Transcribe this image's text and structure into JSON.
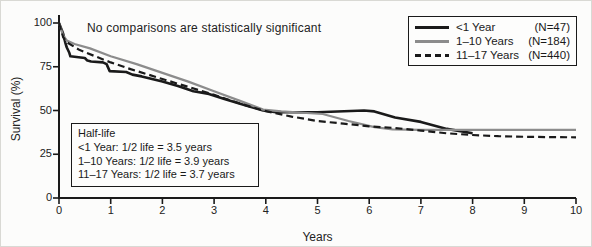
{
  "annotation": "No comparisons are statistically significant",
  "legend": {
    "items": [
      {
        "label": "<1 Year",
        "count": "(N=47)",
        "style": "solid-black"
      },
      {
        "label": "1–10 Years",
        "count": "(N=184)",
        "style": "solid-gray"
      },
      {
        "label": "11–17 Years",
        "count": "(N=440)",
        "style": "dashed-black"
      }
    ]
  },
  "halflife_box": {
    "title": "Half-life",
    "lines": [
      "<1 Year: 1/2 life = 3.5 years",
      "1–10 Years: 1/2 life = 3.9 years",
      "11–17 Years: 1/2 life = 3.7 years"
    ]
  },
  "colors": {
    "black": "#1a1a1a",
    "gray": "#8c8c8c",
    "axis": "#1a1a1a"
  },
  "chart_data": {
    "type": "line",
    "title": "",
    "xlabel": "Years",
    "ylabel": "Survival (%)",
    "xlim": [
      0,
      10
    ],
    "ylim": [
      0,
      100
    ],
    "grid": false,
    "legend_position": "top-right",
    "x_ticks": [
      0,
      1,
      2,
      3,
      4,
      5,
      6,
      7,
      8,
      9,
      10
    ],
    "y_ticks": [
      0,
      25,
      50,
      75,
      100
    ],
    "series": [
      {
        "name": "<1 Year",
        "n": 47,
        "color": "#1a1a1a",
        "dash": "",
        "width": 2.6,
        "points": [
          [
            0,
            100
          ],
          [
            0.08,
            94
          ],
          [
            0.12,
            89
          ],
          [
            0.15,
            86
          ],
          [
            0.2,
            83
          ],
          [
            0.22,
            81
          ],
          [
            0.5,
            80
          ],
          [
            0.55,
            78.5
          ],
          [
            0.62,
            78
          ],
          [
            0.85,
            77.5
          ],
          [
            0.92,
            76.5
          ],
          [
            0.98,
            72.5
          ],
          [
            1.3,
            72
          ],
          [
            1.42,
            70.5
          ],
          [
            1.6,
            69.5
          ],
          [
            1.8,
            68
          ],
          [
            2.0,
            66.5
          ],
          [
            2.3,
            64
          ],
          [
            2.6,
            61
          ],
          [
            2.9,
            59.5
          ],
          [
            3.2,
            56.5
          ],
          [
            3.6,
            53
          ],
          [
            3.95,
            50
          ],
          [
            4.2,
            49
          ],
          [
            5.0,
            49
          ],
          [
            5.9,
            50
          ],
          [
            6.1,
            49.5
          ],
          [
            6.5,
            46
          ],
          [
            7.0,
            43.5
          ],
          [
            7.5,
            39.5
          ],
          [
            8.0,
            37
          ]
        ]
      },
      {
        "name": "1-10 Years",
        "n": 184,
        "color": "#8c8c8c",
        "dash": "",
        "width": 2.2,
        "points": [
          [
            0,
            100
          ],
          [
            0.08,
            93
          ],
          [
            0.15,
            90
          ],
          [
            0.3,
            88
          ],
          [
            0.6,
            85.5
          ],
          [
            1.0,
            81
          ],
          [
            1.5,
            76.5
          ],
          [
            2.0,
            71.5
          ],
          [
            2.5,
            66.5
          ],
          [
            3.0,
            61
          ],
          [
            3.5,
            55.5
          ],
          [
            3.95,
            50.5
          ],
          [
            4.3,
            49.5
          ],
          [
            5.1,
            48
          ],
          [
            5.6,
            44
          ],
          [
            6.1,
            40.5
          ],
          [
            6.45,
            39.2
          ],
          [
            7.0,
            39
          ],
          [
            8.0,
            39
          ],
          [
            9.0,
            39
          ],
          [
            10.0,
            39
          ]
        ]
      },
      {
        "name": "11-17 Years",
        "n": 440,
        "color": "#1a1a1a",
        "dash": "7 4",
        "width": 2.2,
        "points": [
          [
            0,
            100
          ],
          [
            0.08,
            92
          ],
          [
            0.15,
            89
          ],
          [
            0.4,
            84.5
          ],
          [
            0.7,
            81
          ],
          [
            1.0,
            77.5
          ],
          [
            1.4,
            73.5
          ],
          [
            2.0,
            68
          ],
          [
            2.5,
            63.5
          ],
          [
            3.0,
            59
          ],
          [
            3.5,
            54
          ],
          [
            3.95,
            50
          ],
          [
            4.5,
            46.5
          ],
          [
            5.0,
            44
          ],
          [
            5.5,
            42.5
          ],
          [
            6.0,
            41
          ],
          [
            6.5,
            40
          ],
          [
            7.0,
            38.5
          ],
          [
            7.5,
            37
          ],
          [
            8.0,
            36
          ],
          [
            8.5,
            35.3
          ],
          [
            9.0,
            35
          ],
          [
            9.5,
            34.8
          ],
          [
            10.0,
            34.7
          ]
        ]
      }
    ]
  }
}
